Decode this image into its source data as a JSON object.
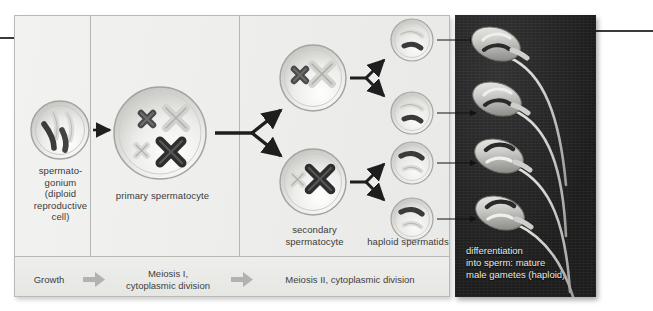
{
  "figure": {
    "panels": {
      "light_panel_name": "meiosis-stages-panel",
      "dark_panel_name": "mature-sperm-photo-panel"
    }
  },
  "cells": {
    "spermatogonium": {
      "label": "spermato-\ngonium\n(diploid\nreproductive\ncell)",
      "chromosome_count": 4,
      "chromosome_form": "unreplicated-rods",
      "chromosomes": [
        {
          "shade": "light",
          "tone": "#d8d8d4"
        },
        {
          "shade": "light",
          "tone": "#d8d8d4"
        },
        {
          "shade": "dark",
          "tone": "#3c3c3c"
        },
        {
          "shade": "dark",
          "tone": "#3c3c3c"
        }
      ]
    },
    "primary_spermatocyte": {
      "label": "primary spermatocyte",
      "chromosome_count": 4,
      "chromosome_form": "replicated-X",
      "chromosomes": [
        {
          "position": "top-left",
          "size": "small",
          "shade": "dark",
          "tone": "#4a4a4a"
        },
        {
          "position": "top-right",
          "size": "large",
          "shade": "light",
          "tone": "#d2d2ce"
        },
        {
          "position": "bottom-left",
          "size": "small",
          "shade": "light",
          "tone": "#d2d2ce"
        },
        {
          "position": "bottom-right",
          "size": "large",
          "shade": "dark",
          "tone": "#2e2e2e"
        }
      ]
    },
    "secondary_spermatocyte": {
      "label": "secondary\nspermatocyte",
      "count": 2,
      "top_cell_chromosomes": [
        {
          "size": "small",
          "shade": "dark",
          "tone": "#4a4a4a"
        },
        {
          "size": "large",
          "shade": "light",
          "tone": "#d2d2ce"
        }
      ],
      "bottom_cell_chromosomes": [
        {
          "size": "small",
          "shade": "light",
          "tone": "#d2d2ce"
        },
        {
          "size": "large",
          "shade": "dark",
          "tone": "#2e2e2e"
        }
      ]
    },
    "haploid_spermatids": {
      "label": "haploid spermatids",
      "count": 4,
      "cells": [
        {
          "index": 1,
          "upper_chromosome": "light",
          "lower_chromosome": "dark"
        },
        {
          "index": 2,
          "upper_chromosome": "light",
          "lower_chromosome": "dark"
        },
        {
          "index": 3,
          "upper_chromosome": "dark",
          "lower_chromosome": "light"
        },
        {
          "index": 4,
          "upper_chromosome": "dark",
          "lower_chromosome": "light"
        }
      ]
    },
    "mature_sperm": {
      "caption": "differentiation\ninto sperm: mature\nmale gametes (haploid)",
      "count": 4
    }
  },
  "stage_band": {
    "stages": [
      {
        "key": "growth",
        "label": "Growth"
      },
      {
        "key": "meiosis_1",
        "label": "Meiosis I,\ncytoplasmic division"
      },
      {
        "key": "meiosis_2",
        "label": "Meiosis II, cytoplasmic division"
      }
    ],
    "arrow_count": 2,
    "arrow_color": "#b2b2ae"
  },
  "colors": {
    "panel_background": "#eeeeec",
    "panel_border": "#b9b9b5",
    "divider": "#b6b6b2",
    "dark_panel": "#242424",
    "text": "#3b3b3b",
    "dark_panel_text": "#e8e8e8",
    "arrow_dark": "#1e1e1e",
    "chromosome_dark": "#3c3c3c",
    "chromosome_light": "#d8d8d4",
    "cell_fill_light": "#f4f4f2",
    "cell_rim": "#a9a9a5",
    "sperm_body": "#d5d5d2"
  }
}
